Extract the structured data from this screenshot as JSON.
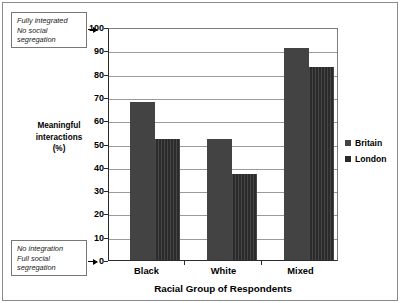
{
  "annotations": {
    "top": "Fully integrated\nNo social\nsegregation",
    "bottom": "No integration\nFull social\nsegregation"
  },
  "axes": {
    "y_title": "Meaningful\ninteractions\n(%)",
    "x_title": "Racial Group of Respondents",
    "y_ticks": [
      "0",
      "10",
      "20",
      "30",
      "40",
      "50",
      "60",
      "70",
      "80",
      "90",
      "100"
    ]
  },
  "legend": {
    "position": "right",
    "items": [
      {
        "label": "Britain",
        "color": "#434343"
      },
      {
        "label": "London",
        "color": "#2b2b2b"
      }
    ]
  },
  "chart_data": {
    "type": "bar",
    "title": "",
    "subtitle": "",
    "categories": [
      "Black",
      "White",
      "Mixed"
    ],
    "series": [
      {
        "name": "Britain",
        "values": [
          68,
          52,
          91
        ],
        "color": "#434343"
      },
      {
        "name": "London",
        "values": [
          52,
          37,
          83
        ],
        "color": "#2b2b2b"
      }
    ],
    "xlabel": "Racial Group of Respondents",
    "ylabel": "Meaningful interactions (%)",
    "ylim": [
      0,
      100
    ],
    "ytick_step": 10,
    "grid": true,
    "legend_position": "right",
    "annotations": [
      {
        "text": "Fully integrated No social segregation",
        "at_value": 100,
        "side": "left"
      },
      {
        "text": "No integration Full social segregation",
        "at_value": 0,
        "side": "left"
      }
    ]
  }
}
